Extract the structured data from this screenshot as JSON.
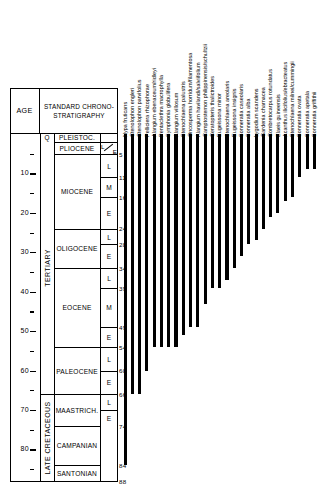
{
  "figure": {
    "type": "stratigraphic-range-chart",
    "title": ""
  },
  "axis": {
    "header_label": "AGE",
    "unit": "Ma",
    "tick_labels": [
      "10",
      "20",
      "30",
      "40",
      "50",
      "60",
      "70",
      "80"
    ],
    "tick_values": [
      10,
      20,
      30,
      40,
      50,
      60,
      70,
      80
    ],
    "minor_tick_values": [
      5,
      15,
      25,
      35,
      45,
      55,
      65,
      75,
      85
    ],
    "range": [
      0,
      88
    ]
  },
  "chrono": {
    "header_label": "STANDARD CHRONO-STRATIGRAPHY",
    "periods": [
      {
        "label": "TERTIARY",
        "top": 0,
        "bottom": 66
      },
      {
        "label": "LATE CRETACEOUS",
        "top": 66,
        "bottom": 88
      }
    ],
    "quaternary_label": "Q",
    "epochs": [
      {
        "label": "PLEISTOC.",
        "top": 0,
        "bottom": 2
      },
      {
        "label": "PLIOCENE",
        "top": 2,
        "bottom": 5
      },
      {
        "label": "MIOCENE",
        "top": 5,
        "bottom": 24
      },
      {
        "label": "OLIGOCENE",
        "top": 24,
        "bottom": 34
      },
      {
        "label": "EOCENE",
        "top": 34,
        "bottom": 54
      },
      {
        "label": "PALEOCENE",
        "top": 54,
        "bottom": 66
      },
      {
        "label": "MAASTRICH.",
        "top": 66,
        "bottom": 74
      },
      {
        "label": "CAMPANIAN",
        "top": 74,
        "bottom": 84
      },
      {
        "label": "SANTONIAN",
        "top": 84,
        "bottom": 88
      }
    ],
    "subdivisions": [
      {
        "label": "L",
        "top": 5,
        "bottom": 11
      },
      {
        "label": "M",
        "top": 11,
        "bottom": 16
      },
      {
        "label": "E",
        "top": 16,
        "bottom": 24
      },
      {
        "label": "L",
        "top": 24,
        "bottom": 28
      },
      {
        "label": "E",
        "top": 28,
        "bottom": 34
      },
      {
        "label": "L",
        "top": 34,
        "bottom": 39
      },
      {
        "label": "M",
        "top": 39,
        "bottom": 49
      },
      {
        "label": "E",
        "top": 49,
        "bottom": 54
      },
      {
        "label": "L",
        "top": 54,
        "bottom": 60
      },
      {
        "label": "E",
        "top": 60,
        "bottom": 66
      },
      {
        "label": "L",
        "top": 66,
        "bottom": 70
      },
      {
        "label": "E",
        "top": 70,
        "bottom": 74
      }
    ],
    "pliocene_sub": {
      "late": "L",
      "early": "E"
    },
    "boundary_labels": [
      "5",
      "11",
      "16",
      "24",
      "28",
      "34",
      "39",
      "49",
      "54",
      "60",
      "66",
      "74",
      "84",
      "88"
    ],
    "boundary_values": [
      5,
      11,
      16,
      24,
      28,
      34,
      39,
      49,
      54,
      60,
      66,
      74,
      84,
      88
    ]
  },
  "chart_data": {
    "type": "bar",
    "title": "",
    "xlabel": "",
    "ylabel": "AGE (Ma)",
    "ylim": [
      0,
      88
    ],
    "grid": false,
    "legend": "none",
    "orientation": "vertical-ranges",
    "note": "Each bar is a taxon stratigraphic range: top = 0 Ma (present), bottom = first appearance age in Ma",
    "categories": [
      "Nypa fruticans",
      "Ctenolophon engleri",
      "Ctenolophon parvifolius",
      "Pelliciera rhizophorae",
      "Alangium ebenaceum/ridleyi",
      "Pentaclethra macrophylla",
      "Symphonia globulifera",
      "Alangium villosum",
      "Stenochlaena palustris",
      "Oncosperma horridum/filamentosa",
      "Alangium havilandi/salviifolium",
      "Camptostemon philippinensis/schultzii",
      "Ceratopteris thalictroides",
      "Eugeissona minor",
      "Stenochlaena areolaris",
      "Eugeissona insignis",
      "Sonneratia caseolaris",
      "Sonneratia alba",
      "Lygodium scandens",
      "Gardenia charnacea",
      "Combretocarpus rotundatus",
      "Elaeis guineensis",
      "Acanthus ilicifolius/ebracteatus",
      "Stenochlaena milnei/cummingii",
      "Sonneratia ovata",
      "Sonneratia apetala",
      "Sonneratia griffithii"
    ],
    "values": [
      84,
      66,
      66,
      60,
      54,
      54,
      54,
      54,
      51,
      49,
      49,
      43,
      39,
      39,
      37,
      34,
      31,
      28,
      27,
      24,
      21,
      20,
      17,
      16,
      11,
      9,
      9
    ],
    "range_tops": [
      0,
      0,
      0,
      0,
      0,
      0,
      0,
      0,
      0,
      0,
      0,
      0,
      0,
      0,
      0,
      0,
      0,
      0,
      0,
      0,
      0,
      0,
      0,
      0,
      0,
      0,
      0
    ],
    "bar_color": "#000000"
  }
}
